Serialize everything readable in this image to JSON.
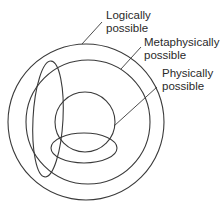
{
  "diagram": {
    "title": "",
    "stroke_color": "#3a3a3a",
    "text_color": "#2a2a2a",
    "regions": [
      {
        "id": "logically-possible",
        "label_lines": [
          "Logically",
          "possible"
        ],
        "shape": "circle",
        "cx": 86,
        "cy": 122,
        "r": 78
      },
      {
        "id": "metaphysically-possible",
        "label_lines": [
          "Metaphysically",
          "possible"
        ],
        "shape": "circle",
        "cx": 88,
        "cy": 122,
        "r": 62
      },
      {
        "id": "physically-possible",
        "label_lines": [
          "Physically",
          "possible"
        ],
        "shape": "circle",
        "cx": 85,
        "cy": 122,
        "r": 30
      }
    ],
    "unlabeled_ellipses": [
      {
        "id": "vertical-ellipse",
        "cx": 48,
        "cy": 119,
        "rx": 15,
        "ry": 58
      },
      {
        "id": "horizontal-ellipse",
        "cx": 84,
        "cy": 148,
        "rx": 33,
        "ry": 15
      }
    ],
    "labels": {
      "logical": {
        "line1": "Logically",
        "line2": "possible"
      },
      "metaphysical": {
        "line1": "Metaphysically",
        "line2": "possible"
      },
      "physical": {
        "line1": "Physically",
        "line2": "possible"
      }
    }
  }
}
